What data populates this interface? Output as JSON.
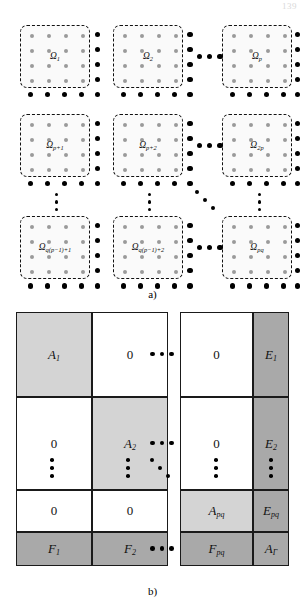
{
  "page": {
    "number": "139"
  },
  "figure": {
    "panel_a": {
      "caption": "a)",
      "kind": "subdomain-decomposition-grid",
      "subdomains": [
        {
          "label": "Ω",
          "sub": "1",
          "row": 0,
          "col": 0
        },
        {
          "label": "Ω",
          "sub": "2",
          "row": 0,
          "col": 1
        },
        {
          "label": "Ω",
          "sub": "p",
          "row": 0,
          "col": 2
        },
        {
          "label": "Ω",
          "sub": "p+1",
          "row": 1,
          "col": 0
        },
        {
          "label": "Ω",
          "sub": "p+2",
          "row": 1,
          "col": 1
        },
        {
          "label": "Ω",
          "sub": "2p",
          "row": 1,
          "col": 2
        },
        {
          "label": "Ω",
          "sub": "q(p−1)+1",
          "row": 2,
          "col": 0
        },
        {
          "label": "Ω",
          "sub": "q(p−1)+2",
          "row": 2,
          "col": 1
        },
        {
          "label": "Ω",
          "sub": "pq",
          "row": 2,
          "col": 2
        }
      ],
      "interior_dots_per_subdomain": 16,
      "interior_dot_color": "#9a9a9a",
      "interface_dot_color": "#000000",
      "ellipsis_horizontal": "⋯",
      "ellipsis_vertical": "⋮",
      "ellipsis_diagonal": "⋱"
    },
    "panel_b": {
      "caption": "b)",
      "kind": "block-matrix",
      "colors": {
        "diagonal_block": "#d4d4d4",
        "coupling_block": "#a9a9a9",
        "zero_block": "#ffffff",
        "border": "#1a1a1a"
      },
      "rows": [
        {
          "cells": [
            {
              "text": "A",
              "sub": "1",
              "fill": "light",
              "zero": false
            },
            {
              "text": "0",
              "sub": "",
              "fill": "white",
              "zero": true
            },
            {
              "text": "0",
              "sub": "",
              "fill": "white",
              "zero": true
            },
            {
              "text": "E",
              "sub": "1",
              "fill": "mid",
              "zero": false
            }
          ]
        },
        {
          "cells": [
            {
              "text": "0",
              "sub": "",
              "fill": "white",
              "zero": true
            },
            {
              "text": "A",
              "sub": "2",
              "fill": "light",
              "zero": false
            },
            {
              "text": "0",
              "sub": "",
              "fill": "white",
              "zero": true
            },
            {
              "text": "E",
              "sub": "2",
              "fill": "mid",
              "zero": false
            }
          ]
        },
        {
          "cells": [
            {
              "text": "0",
              "sub": "",
              "fill": "white",
              "zero": true
            },
            {
              "text": "0",
              "sub": "",
              "fill": "white",
              "zero": true
            },
            {
              "text": "A",
              "sub": "pq",
              "fill": "light",
              "zero": false
            },
            {
              "text": "E",
              "sub": "pq",
              "fill": "mid",
              "zero": false
            }
          ]
        },
        {
          "cells": [
            {
              "text": "F",
              "sub": "1",
              "fill": "mid",
              "zero": false
            },
            {
              "text": "F",
              "sub": "2",
              "fill": "mid",
              "zero": false
            },
            {
              "text": "F",
              "sub": "pq",
              "fill": "mid",
              "zero": false
            },
            {
              "text": "A",
              "sub": "Γ",
              "fill": "mid",
              "zero": false
            }
          ]
        }
      ]
    }
  }
}
